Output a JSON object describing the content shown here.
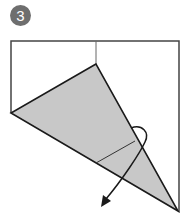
{
  "step": {
    "number": "3"
  },
  "diagram": {
    "colors": {
      "paper": "#ffffff",
      "flap": "#c8c8c8",
      "line": "#1a1a1a",
      "crease": "#555555",
      "badge": "#6e6e6e"
    }
  }
}
